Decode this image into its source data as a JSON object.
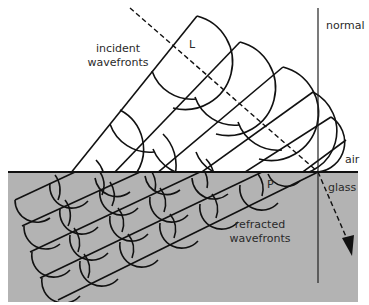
{
  "labels": {
    "incident_line1": "incident",
    "incident_line2": "wavefronts",
    "refracted_line1": "refracted",
    "refracted_line2": "wavefronts",
    "normal": "normal",
    "air": "air",
    "glass": "glass",
    "point_L": "L",
    "point_P": "P"
  },
  "colors": {
    "glass_fill": "#b3b3b3",
    "line": "#111111",
    "background": "#ffffff"
  },
  "media": [
    "air",
    "glass"
  ]
}
